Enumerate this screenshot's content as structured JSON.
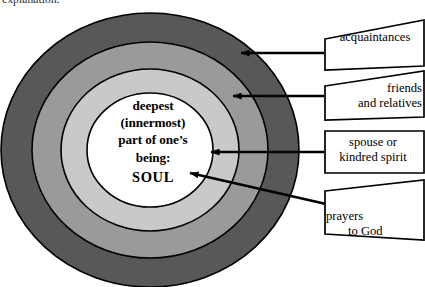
{
  "page": {
    "cut_off_text": "explanation.",
    "background_color": "#ffffff"
  },
  "diagram": {
    "center": {
      "line1": "deepest",
      "line2": "(innermost)",
      "line3": "part of one’s",
      "line4": "being:",
      "line5": "SOUL"
    },
    "rings": [
      {
        "name": "outermost-ring",
        "color": "#585858",
        "label_ref": "acquaintances"
      },
      {
        "name": "second-ring",
        "color": "#9a9a9a",
        "label_ref": "friends and relatives"
      },
      {
        "name": "third-ring",
        "color": "#c9c9c9",
        "label_ref": "spouse or kindred spirit"
      },
      {
        "name": "core-circle",
        "color": "#ffffff",
        "label_ref": "prayers to God"
      }
    ],
    "stroke_color": "#000000"
  },
  "labels": {
    "acquaintances": "acquaintances",
    "friends_relatives": "friends\nand relatives",
    "spouse_kindred": "spouse or\nkindred spirit",
    "prayers_god_line1": "prayers",
    "prayers_god_line2": "to God"
  }
}
